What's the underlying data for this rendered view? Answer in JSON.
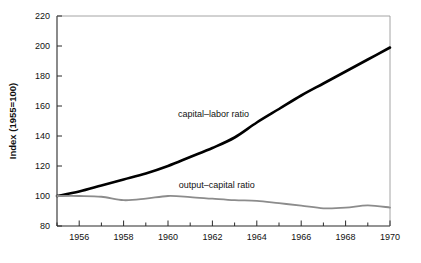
{
  "chart_data": {
    "type": "line",
    "title": "",
    "xlabel": "",
    "ylabel": "Index  (1955=100)",
    "xlim": [
      1955,
      1970
    ],
    "ylim": [
      80,
      220
    ],
    "grid": false,
    "legend_position": "inline-annotations",
    "x": [
      1955,
      1956,
      1957,
      1958,
      1959,
      1960,
      1961,
      1962,
      1963,
      1964,
      1965,
      1966,
      1967,
      1968,
      1969,
      1970
    ],
    "xticks": [
      1956,
      1958,
      1960,
      1962,
      1964,
      1966,
      1968,
      1970
    ],
    "xtick_labels": [
      "1956",
      "1958",
      "1960",
      "1962",
      "1964",
      "1966",
      "1968",
      "1970"
    ],
    "yticks": [
      80,
      100,
      120,
      140,
      160,
      180,
      200,
      220
    ],
    "ytick_labels": [
      "80",
      "100",
      "120",
      "140",
      "160",
      "180",
      "200",
      "220"
    ],
    "series": [
      {
        "name": "capital-labor ratio",
        "label": "capital–labor ratio",
        "color": "#000000",
        "width": 2.6,
        "values": [
          100,
          103,
          107,
          111,
          115,
          120,
          126,
          132,
          139,
          149,
          158,
          167,
          175,
          183,
          191,
          199
        ]
      },
      {
        "name": "output-capital ratio",
        "label": "output–capital ratio",
        "color": "#8c8c8c",
        "width": 1.8,
        "values": [
          100,
          100,
          99.5,
          97.2,
          98.2,
          100,
          99.3,
          98.2,
          97.2,
          96.8,
          95.2,
          93.6,
          91.8,
          92.2,
          93.8,
          92.3
        ]
      }
    ],
    "annotations": [
      {
        "text": "capital–labor ratio",
        "x": 1962.05,
        "y": 152.5,
        "anchor": "middle"
      },
      {
        "text": "output–capital ratio",
        "x": 1962.2,
        "y": 105.5,
        "anchor": "middle"
      }
    ]
  },
  "axes": {
    "y_axis_title": "Index  (1955=100)"
  }
}
